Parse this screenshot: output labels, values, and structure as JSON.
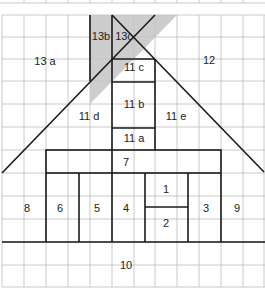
{
  "diagram": {
    "colors": {
      "grid": "#bdbdbd",
      "lines": "#1a1a1a",
      "shade": "#c4c4c4",
      "background": "#ffffff"
    },
    "labels": {
      "l13a": "13 a",
      "l13b": "13b",
      "l13c": "13c",
      "l12": "12",
      "l11c": "11 c",
      "l11b": "11 b",
      "l11d": "11 d",
      "l11e": "11 e",
      "l11a": "11 a",
      "l7": "7",
      "l8": "8",
      "l6": "6",
      "l5": "5",
      "l4": "4",
      "l1": "1",
      "l2": "2",
      "l3": "3",
      "l9": "9",
      "l10": "10"
    }
  }
}
